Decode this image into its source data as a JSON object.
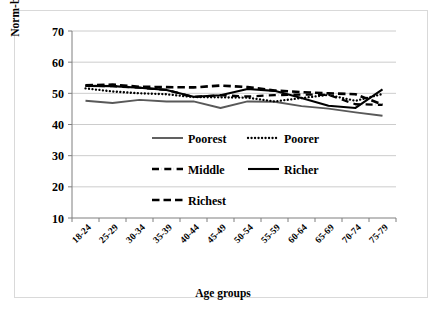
{
  "figure": {
    "border_color": "#d9d9d9",
    "background": "#ffffff"
  },
  "chart_data": {
    "type": "line",
    "title": "",
    "xlabel": "Age groups",
    "ylabel": "Norm-based scores",
    "categories": [
      "18-24",
      "25-29",
      "30-34",
      "35-39",
      "40-44",
      "45-49",
      "50-54",
      "55-59",
      "60-64",
      "65-69",
      "70-74",
      "75-79"
    ],
    "ylim": [
      10,
      70
    ],
    "yticks": [
      10,
      20,
      30,
      40,
      50,
      60,
      70
    ],
    "grid": true,
    "grid_color": "#bfbfbf",
    "legend_position": "inside-lower-center",
    "series": [
      {
        "name": "Poorest",
        "style": "solid-thin",
        "color": "#595959",
        "values": [
          47.6,
          46.9,
          47.9,
          47.4,
          47.4,
          45.3,
          47.4,
          47.3,
          45.9,
          45.1,
          43.9,
          42.8
        ]
      },
      {
        "name": "Poorer",
        "style": "dotted",
        "color": "#000000",
        "values": [
          51.6,
          50.6,
          50.0,
          49.7,
          48.8,
          48.7,
          48.6,
          47.4,
          48.5,
          49.5,
          47.6,
          49.8
        ]
      },
      {
        "name": "Middle",
        "style": "dash-dot",
        "color": "#000000",
        "values": [
          52.5,
          52.3,
          51.8,
          51.1,
          48.8,
          49.4,
          49.0,
          49.4,
          49.6,
          49.5,
          46.5,
          46.3
        ]
      },
      {
        "name": "Richer",
        "style": "solid-thick",
        "color": "#000000",
        "values": [
          52.4,
          52.3,
          51.8,
          51.1,
          48.9,
          49.4,
          51.4,
          50.8,
          48.5,
          46.0,
          45.3,
          51.3
        ]
      },
      {
        "name": "Richest",
        "style": "dashed",
        "color": "#000000",
        "values": [
          52.6,
          52.8,
          52.1,
          52.0,
          51.9,
          52.5,
          52.0,
          50.9,
          50.4,
          50.0,
          49.7,
          46.4
        ]
      }
    ]
  },
  "legend": {
    "entries": [
      {
        "label": "Poorest",
        "style": "solid-thin"
      },
      {
        "label": "Poorer",
        "style": "dotted"
      },
      {
        "label": "Middle",
        "style": "dash-dot"
      },
      {
        "label": "Richer",
        "style": "solid-thick"
      },
      {
        "label": "Richest",
        "style": "dashed"
      }
    ]
  }
}
